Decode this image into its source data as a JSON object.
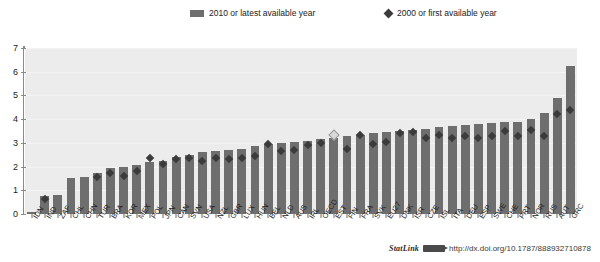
{
  "legend": {
    "bar_label": "2010 or latest available year",
    "point_label": "2000 or first available year",
    "bar_color": "#6e6e6e",
    "point_color": "#3b3b3b"
  },
  "footer": {
    "statlink_label": "StatLink",
    "url": "http://dx.doi.org/10.1787/888932710878"
  },
  "chart_data": {
    "type": "bar",
    "title": "",
    "subtitle": "",
    "xlabel": "",
    "ylabel": "",
    "ylim": [
      0,
      7
    ],
    "yticks": [
      0,
      1,
      2,
      3,
      4,
      5,
      6,
      7
    ],
    "ytick_labels": [
      "0",
      "1",
      "2",
      "3",
      "4",
      "5",
      "6",
      "7"
    ],
    "grid": true,
    "legend_position": "top",
    "plot_background": "#ececec",
    "categories": [
      "IDN",
      "IND",
      "ZAF",
      "CHL",
      "CHN",
      "TUR",
      "BRA",
      "KOR",
      "MEX",
      "POL",
      "JPN",
      "CAN",
      "SVN",
      "USA",
      "NZL",
      "GBR",
      "LUX",
      "HUN",
      "BEL",
      "NLD",
      "AUS",
      "IRL",
      "OECD",
      "EST",
      "FIN",
      "FRA",
      "SVK",
      "EU27",
      "DNK",
      "ISR",
      "CZE",
      "ISL",
      "ITA",
      "DEU",
      "ESP",
      "SWE",
      "CHE",
      "PRT",
      "NOR",
      "RUS",
      "AUT",
      "GRC"
    ],
    "series": [
      {
        "name": "2010 or latest available year",
        "type": "bar",
        "values": [
          0.1,
          0.75,
          0.8,
          1.5,
          1.55,
          1.75,
          1.95,
          2.0,
          2.05,
          2.2,
          2.25,
          2.4,
          2.5,
          2.6,
          2.65,
          2.7,
          2.75,
          2.85,
          2.95,
          3.0,
          3.05,
          3.1,
          3.15,
          3.2,
          3.3,
          3.35,
          3.4,
          3.45,
          3.5,
          3.55,
          3.6,
          3.65,
          3.7,
          3.75,
          3.8,
          3.85,
          3.9,
          3.9,
          4.0,
          4.25,
          4.9,
          6.25
        ]
      },
      {
        "name": "2000 or first available year",
        "type": "scatter",
        "marker": "diamond",
        "values": [
          null,
          0.65,
          null,
          null,
          null,
          1.55,
          1.75,
          1.6,
          1.8,
          2.35,
          2.1,
          2.3,
          2.35,
          2.25,
          2.35,
          2.3,
          2.35,
          2.45,
          2.95,
          2.65,
          2.7,
          2.9,
          3.0,
          3.35,
          2.75,
          3.35,
          2.95,
          3.05,
          3.4,
          3.45,
          3.2,
          3.35,
          3.2,
          3.3,
          3.2,
          3.3,
          3.5,
          3.3,
          3.55,
          3.3,
          4.2,
          4.4
        ],
        "hollow_indices": [
          23
        ]
      }
    ]
  }
}
